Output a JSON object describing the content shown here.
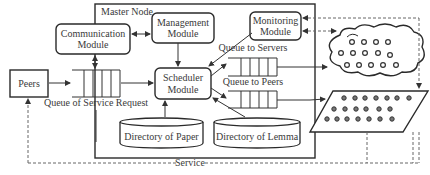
{
  "diagram": {
    "container": {
      "label": "Master Node"
    },
    "modules": {
      "communication": {
        "line1": "Communication",
        "line2": "Module"
      },
      "management": {
        "line1": "Management",
        "line2": "Module"
      },
      "monitoring": {
        "line1": "Monitoring",
        "line2": "Module"
      },
      "scheduler": {
        "line1": "Scheduler",
        "line2": "Module"
      }
    },
    "peers": {
      "label": "Peers"
    },
    "queues": {
      "service_request": {
        "label": "Queue of Service Request",
        "slots": 4
      },
      "to_servers": {
        "label": "Queue to Servers",
        "slots": 5
      },
      "to_peers": {
        "label": "Queue to Peers",
        "slots": 5
      }
    },
    "directories": {
      "paper": {
        "label": "Directory of Paper"
      },
      "lemma": {
        "label": "Directory of Lemma"
      }
    },
    "server_cloud": {
      "nodes_rows": [
        4,
        5,
        5
      ]
    },
    "peer_grid": {
      "nodes_rows": [
        7,
        6,
        7
      ]
    },
    "service": {
      "label": "Service"
    }
  }
}
